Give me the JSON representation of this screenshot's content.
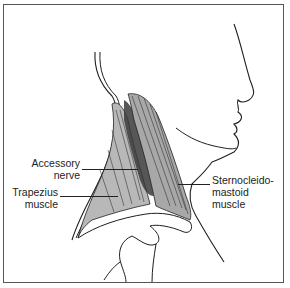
{
  "figure": {
    "labels": [
      {
        "id": "accessory",
        "lines": [
          "Accessory",
          "nerve"
        ]
      },
      {
        "id": "trapezius",
        "lines": [
          "Trapezius",
          "muscle"
        ]
      },
      {
        "id": "scm",
        "lines": [
          "Sternocleido-",
          "mastoid",
          "muscle"
        ]
      }
    ],
    "colors": {
      "line": "#1f1f1f",
      "muscle_shade": "#b8b8b8",
      "muscle_dark": "#3a3a3a",
      "border": "#555555"
    }
  }
}
